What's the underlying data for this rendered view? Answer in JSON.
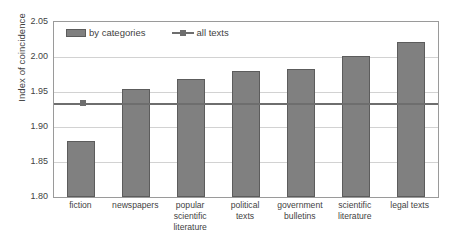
{
  "chart_data": {
    "type": "bar",
    "title": "",
    "xlabel": "",
    "ylabel": "Index of coincidence",
    "ylim": [
      1.8,
      2.05
    ],
    "ytick_labels": [
      "2.05",
      "2.00",
      "1.95",
      "1.90",
      "1.85",
      "1.80"
    ],
    "yticks": [
      2.05,
      2.0,
      1.95,
      1.9,
      1.85,
      1.8
    ],
    "grid": true,
    "legend_position": "top-left-inside",
    "categories": [
      "fiction",
      "newspapers",
      "popular scientific literature",
      "political texts",
      "government bulletins",
      "scientific literature",
      "legal texts"
    ],
    "category_lines": [
      [
        "fiction"
      ],
      [
        "newspapers"
      ],
      [
        "popular",
        "scientific",
        "literature"
      ],
      [
        "political",
        "texts"
      ],
      [
        "government",
        "bulletins"
      ],
      [
        "scientific",
        "literature"
      ],
      [
        "legal texts"
      ]
    ],
    "series": [
      {
        "name": "by categories",
        "kind": "bar",
        "values": [
          1.88,
          1.954,
          1.968,
          1.98,
          1.983,
          2.001,
          2.022
        ]
      },
      {
        "name": "all texts",
        "kind": "reference-line",
        "value": 1.933
      }
    ],
    "colors": {
      "bar_fill": "#808080",
      "bar_border": "#5c5c5c",
      "reference_line": "#6e6e6e",
      "gridline": "#d2d2d2",
      "frame": "#9a9a9a",
      "text": "#3f3f3f",
      "background": "#ffffff"
    }
  },
  "legend": {
    "items": [
      {
        "label": "by categories"
      },
      {
        "label": "all texts"
      }
    ]
  }
}
